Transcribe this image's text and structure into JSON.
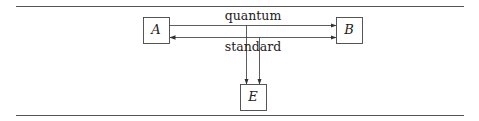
{
  "diagram": {
    "nodes": [
      {
        "id": "A",
        "label": "A"
      },
      {
        "id": "B",
        "label": "B"
      },
      {
        "id": "E",
        "label": "E"
      }
    ],
    "edges": [
      {
        "from": "A",
        "to": "B",
        "label": "quantum",
        "direction": "forward"
      },
      {
        "from": "A",
        "to": "B",
        "label": "standard",
        "direction": "both"
      },
      {
        "from": "quantum",
        "to": "E",
        "label": "",
        "direction": "forward"
      },
      {
        "from": "standard",
        "to": "E",
        "label": "",
        "direction": "forward"
      }
    ],
    "labels": {
      "quantum": "quantum",
      "standard": "standard"
    },
    "colors": {
      "line": "#333333",
      "rule": "#555555",
      "box_border": "#444444"
    }
  }
}
